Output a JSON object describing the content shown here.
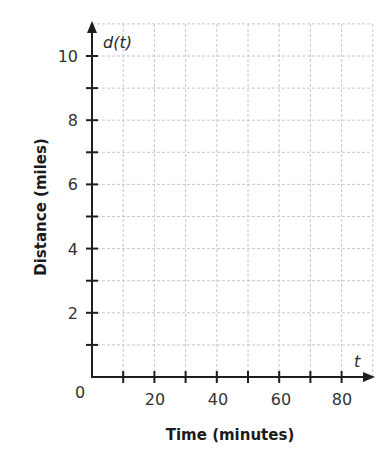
{
  "chart_data": {
    "type": "line",
    "title": "",
    "xlabel": "Time (minutes)",
    "ylabel": "Distance (miles)",
    "x_variable": "t",
    "y_variable": "d(t)",
    "xlim": [
      0,
      90
    ],
    "ylim": [
      0,
      11
    ],
    "x_ticks": [
      0,
      10,
      20,
      30,
      40,
      50,
      60,
      70,
      80
    ],
    "x_tick_labels": [
      "20",
      "40",
      "60",
      "80"
    ],
    "x_tick_label_values": [
      20,
      40,
      60,
      80
    ],
    "y_ticks": [
      1,
      2,
      3,
      4,
      5,
      6,
      7,
      8,
      9,
      10
    ],
    "y_tick_labels": [
      "2",
      "4",
      "6",
      "8",
      "10"
    ],
    "y_tick_label_values": [
      2,
      4,
      6,
      8,
      10
    ],
    "origin_label": "0",
    "grid": true,
    "grid_x_step": 10,
    "grid_y_step": 1,
    "series": []
  },
  "labels": {
    "x_axis_title": "Time (minutes)",
    "y_axis_title": "Distance (miles)",
    "x_var": "t",
    "y_var": "d(t)",
    "origin": "0",
    "x_ticks": [
      "20",
      "40",
      "60",
      "80"
    ],
    "y_ticks": [
      "2",
      "4",
      "6",
      "8",
      "10"
    ]
  },
  "colors": {
    "axis": "#1e1e1e",
    "grid": "#c8c8c8",
    "text": "#333333"
  }
}
